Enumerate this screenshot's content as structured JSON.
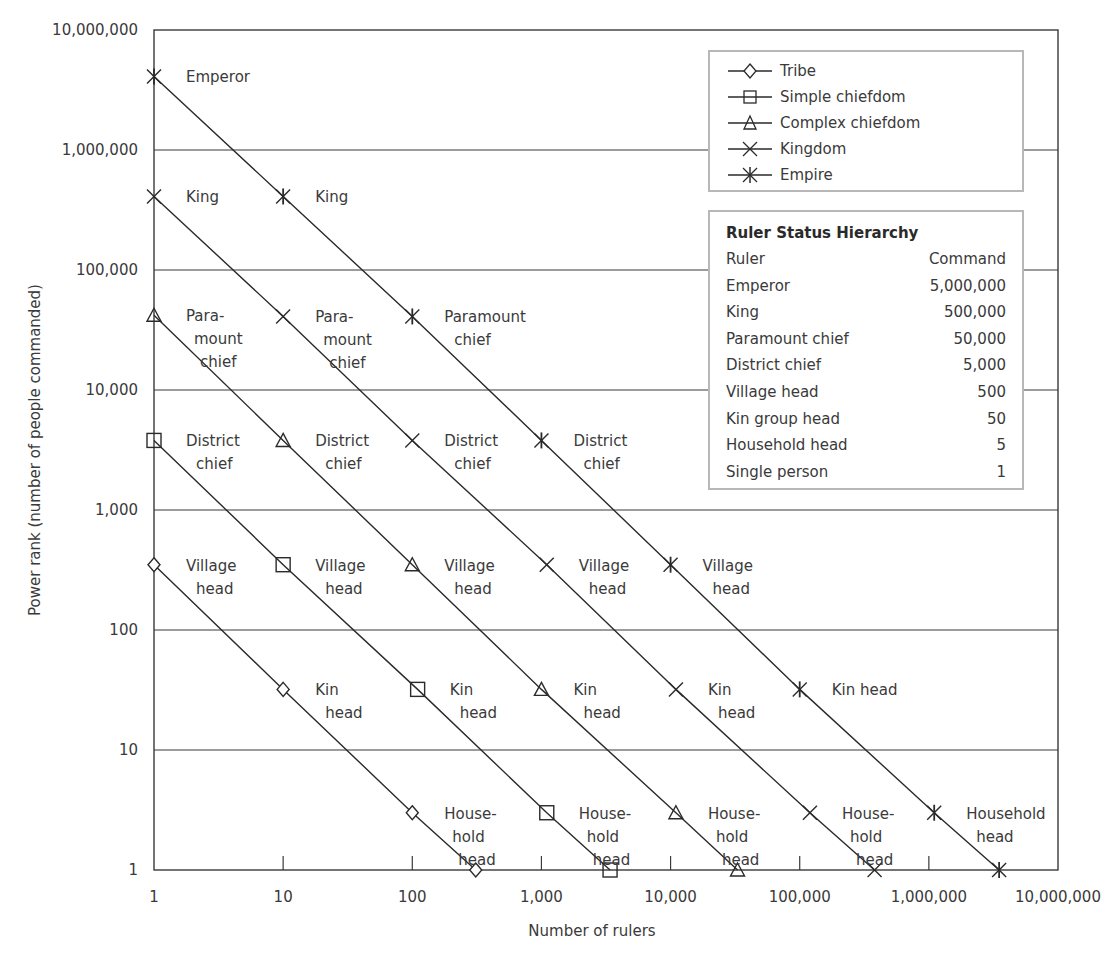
{
  "chart_data": {
    "type": "line",
    "title": "",
    "xlabel": "Number of rulers",
    "ylabel": "Power rank (number of people commanded)",
    "xscale": "log",
    "yscale": "log",
    "xlim": [
      1,
      10000000
    ],
    "ylim": [
      1,
      10000000
    ],
    "grid": {
      "horizontal": true,
      "vertical": false
    },
    "x_ticks": [
      "1",
      "10",
      "100",
      "1,000",
      "10,000",
      "100,000",
      "1,000,000",
      "10,000,000"
    ],
    "y_ticks": [
      "1",
      "10",
      "100",
      "1,000",
      "10,000",
      "100,000",
      "1,000,000",
      "10,000,000"
    ],
    "legend_position": "upper right",
    "series": [
      {
        "name": "Tribe",
        "marker": "diamond",
        "points": [
          [
            1,
            350
          ],
          [
            10,
            32
          ],
          [
            100,
            3
          ],
          [
            310,
            1
          ]
        ],
        "labels": [
          [
            "Village",
            "head"
          ],
          [
            "Kin",
            "head"
          ],
          [
            "House-",
            "hold",
            "head"
          ],
          []
        ]
      },
      {
        "name": "Simple chiefdom",
        "marker": "square",
        "points": [
          [
            1,
            3800
          ],
          [
            10,
            350
          ],
          [
            110,
            32
          ],
          [
            1100,
            3
          ],
          [
            3400,
            1
          ]
        ],
        "labels": [
          [
            "District",
            "chief"
          ],
          [
            "Village",
            "head"
          ],
          [
            "Kin",
            "head"
          ],
          [
            "House-",
            "hold",
            "head"
          ],
          []
        ]
      },
      {
        "name": "Complex chiefdom",
        "marker": "triangle",
        "points": [
          [
            1,
            42000
          ],
          [
            10,
            3800
          ],
          [
            100,
            350
          ],
          [
            1000,
            32
          ],
          [
            11000,
            3
          ],
          [
            33000,
            1
          ]
        ],
        "labels": [
          [
            "Para-",
            "mount",
            "chief"
          ],
          [
            "District",
            "chief"
          ],
          [
            "Village",
            "head"
          ],
          [
            "Kin",
            "head"
          ],
          [
            "House-",
            "hold",
            "head"
          ],
          []
        ]
      },
      {
        "name": "Kingdom",
        "marker": "x",
        "points": [
          [
            1,
            410000
          ],
          [
            10,
            41000
          ],
          [
            100,
            3800
          ],
          [
            1100,
            350
          ],
          [
            11000,
            32
          ],
          [
            120000,
            3
          ],
          [
            380000,
            1
          ]
        ],
        "labels": [
          [
            "King"
          ],
          [
            "Para-",
            "mount",
            "chief"
          ],
          [
            "District",
            "chief"
          ],
          [
            "Village",
            "head"
          ],
          [
            "Kin",
            "head"
          ],
          [
            "House-",
            "hold",
            "head"
          ],
          []
        ]
      },
      {
        "name": "Empire",
        "marker": "asterisk",
        "points": [
          [
            1,
            4100000
          ],
          [
            10,
            410000
          ],
          [
            100,
            41000
          ],
          [
            1000,
            3800
          ],
          [
            10000,
            350
          ],
          [
            100000,
            32
          ],
          [
            1100000,
            3
          ],
          [
            3500000,
            1
          ]
        ],
        "labels": [
          [
            "Emperor"
          ],
          [
            "King"
          ],
          [
            "Paramount",
            "chief"
          ],
          [
            "District",
            "chief"
          ],
          [
            "Village",
            "head"
          ],
          [
            "Kin head"
          ],
          [
            "Household",
            "head"
          ],
          []
        ]
      }
    ]
  },
  "legend": {
    "items": [
      {
        "label": "Tribe",
        "marker": "diamond-icon"
      },
      {
        "label": "Simple chiefdom",
        "marker": "square-icon"
      },
      {
        "label": "Complex chiefdom",
        "marker": "triangle-icon"
      },
      {
        "label": "Kingdom",
        "marker": "x-icon"
      },
      {
        "label": "Empire",
        "marker": "asterisk-icon"
      }
    ]
  },
  "ruler_table": {
    "title": "Ruler Status Hierarchy",
    "header": {
      "ruler": "Ruler",
      "command": "Command"
    },
    "rows": [
      {
        "ruler": "Emperor",
        "command": "5,000,000"
      },
      {
        "ruler": "King",
        "command": "500,000"
      },
      {
        "ruler": "Paramount chief",
        "command": "50,000"
      },
      {
        "ruler": "District chief",
        "command": "5,000"
      },
      {
        "ruler": "Village head",
        "command": "500"
      },
      {
        "ruler": "Kin group head",
        "command": "50"
      },
      {
        "ruler": "Household head",
        "command": "5"
      },
      {
        "ruler": "Single person",
        "command": "1"
      }
    ]
  },
  "colors": {
    "line": "#2a2a2a",
    "grid": "#3a3a3a",
    "box_border": "#b8b8b8",
    "text": "#3a3a3a"
  }
}
